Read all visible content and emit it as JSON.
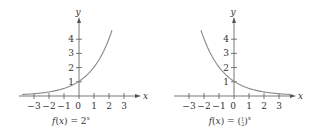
{
  "chart_data": [
    {
      "type": "line",
      "title": "f(x) = 2^x",
      "caption_prefix": "f(x) = 2",
      "caption_exp": "x",
      "xlabel": "x",
      "ylabel": "y",
      "x_ticks": [
        "−3",
        "−2",
        "−1",
        "0",
        "1",
        "2",
        "3"
      ],
      "y_ticks": [
        "1",
        "2",
        "3",
        "4"
      ],
      "xlim": [
        -3.8,
        4
      ],
      "ylim": [
        0,
        5
      ],
      "function": "2^x",
      "x": [
        -3.8,
        -3,
        -2,
        -1,
        0,
        1,
        2,
        2.2
      ],
      "y": [
        0.07,
        0.125,
        0.25,
        0.5,
        1,
        2,
        4,
        4.6
      ]
    },
    {
      "type": "line",
      "title": "f(x) = (1/2)^x",
      "caption_prefix": "f(x) = (",
      "caption_frac": "1/2",
      "caption_suffix": ")",
      "caption_exp": "x",
      "xlabel": "x",
      "ylabel": "y",
      "x_ticks": [
        "−3",
        "−2",
        "−1",
        "0",
        "1",
        "2",
        "3"
      ],
      "y_ticks": [
        "1",
        "2",
        "3",
        "4"
      ],
      "xlim": [
        -3.8,
        4
      ],
      "ylim": [
        0,
        5
      ],
      "function": "(1/2)^x",
      "x": [
        -2.2,
        -2,
        -1,
        0,
        1,
        2,
        3,
        3.8
      ],
      "y": [
        4.6,
        4,
        2,
        1,
        0.5,
        0.25,
        0.125,
        0.07
      ]
    }
  ],
  "colors": {
    "curve": "#8a8a8a",
    "axis": "#555555",
    "text": "#333333"
  }
}
